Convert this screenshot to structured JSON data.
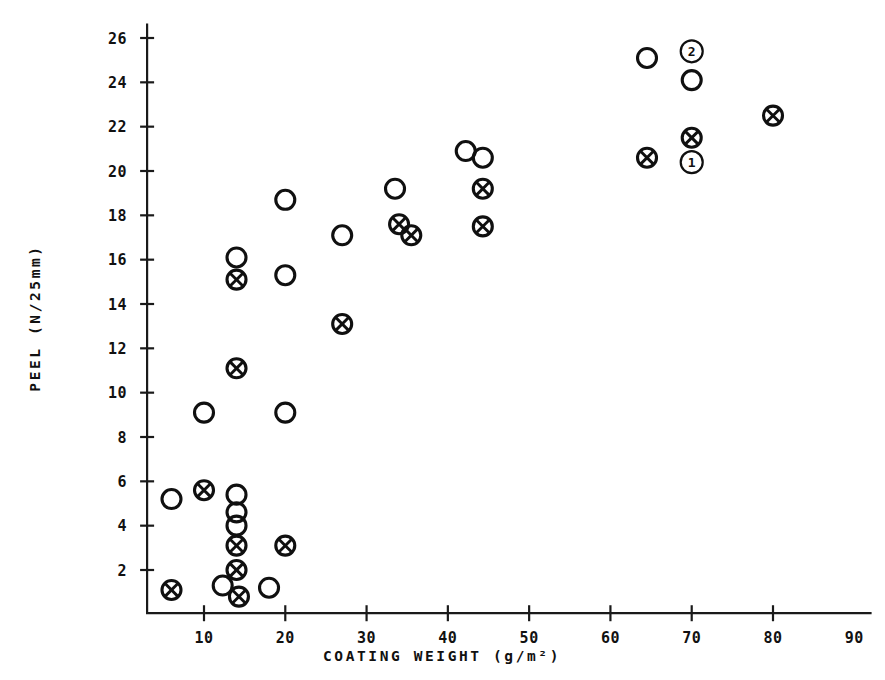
{
  "chart_data": {
    "type": "scatter",
    "title": "",
    "xlabel": "COATING WEIGHT (g/m²)",
    "ylabel": "PEEL (N/25mm)",
    "xlim": [
      3,
      92
    ],
    "ylim": [
      0,
      26.6
    ],
    "xticks": [
      10,
      20,
      30,
      40,
      50,
      60,
      70,
      80,
      90
    ],
    "xtick_labels": [
      "10",
      "20",
      "30",
      "40",
      "50",
      "60",
      "70",
      "80",
      "90"
    ],
    "yticks": [
      2,
      4,
      6,
      8,
      10,
      12,
      14,
      16,
      18,
      20,
      22,
      24,
      26
    ],
    "ytick_labels": [
      "2",
      "4",
      "6",
      "8",
      "10",
      "12",
      "14",
      "16",
      "18",
      "20",
      "22",
      "24",
      "26"
    ],
    "grid": false,
    "legend": "none",
    "series": [
      {
        "name": "open-circle",
        "marker": "open-circle",
        "points": [
          {
            "x": 6.0,
            "y": 5.2
          },
          {
            "x": 12.3,
            "y": 1.3
          },
          {
            "x": 10.0,
            "y": 9.1
          },
          {
            "x": 14.0,
            "y": 5.4
          },
          {
            "x": 14.0,
            "y": 4.6
          },
          {
            "x": 14.0,
            "y": 4.0
          },
          {
            "x": 14.0,
            "y": 16.1
          },
          {
            "x": 18.0,
            "y": 1.2
          },
          {
            "x": 20.0,
            "y": 9.1
          },
          {
            "x": 20.0,
            "y": 15.3
          },
          {
            "x": 20.0,
            "y": 18.7
          },
          {
            "x": 27.0,
            "y": 17.1
          },
          {
            "x": 33.5,
            "y": 19.2
          },
          {
            "x": 42.2,
            "y": 20.9
          },
          {
            "x": 44.3,
            "y": 20.6
          },
          {
            "x": 64.5,
            "y": 25.1
          },
          {
            "x": 70.0,
            "y": 24.1
          }
        ]
      },
      {
        "name": "crossed-circle",
        "marker": "crossed-circle",
        "points": [
          {
            "x": 6.0,
            "y": 1.1
          },
          {
            "x": 10.0,
            "y": 5.6
          },
          {
            "x": 14.0,
            "y": 3.1
          },
          {
            "x": 14.0,
            "y": 2.0
          },
          {
            "x": 14.3,
            "y": 0.8
          },
          {
            "x": 14.0,
            "y": 11.1
          },
          {
            "x": 14.0,
            "y": 15.1
          },
          {
            "x": 20.0,
            "y": 3.1
          },
          {
            "x": 27.0,
            "y": 13.1
          },
          {
            "x": 34.0,
            "y": 17.6
          },
          {
            "x": 35.5,
            "y": 17.1
          },
          {
            "x": 44.3,
            "y": 19.2
          },
          {
            "x": 44.3,
            "y": 17.5
          },
          {
            "x": 64.5,
            "y": 20.6
          },
          {
            "x": 70.0,
            "y": 21.5
          },
          {
            "x": 80.0,
            "y": 22.5
          }
        ]
      }
    ],
    "annotations": [
      {
        "label": "2",
        "x": 70.0,
        "y": 25.4,
        "style": "circled-number"
      },
      {
        "label": "1",
        "x": 70.0,
        "y": 20.4,
        "style": "circled-number"
      }
    ]
  },
  "colors": {
    "ink": "#101010",
    "background": "#ffffff"
  }
}
